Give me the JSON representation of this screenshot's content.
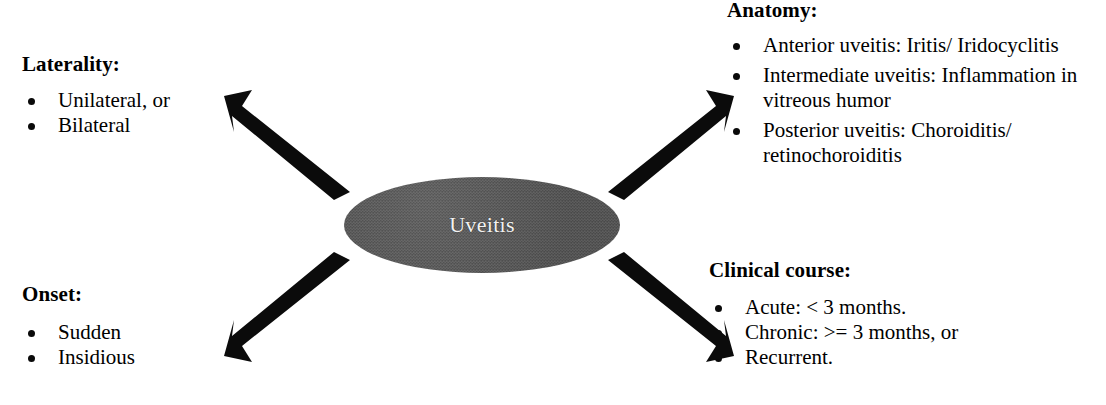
{
  "diagram": {
    "center": {
      "label": "Uveitis",
      "shape": "ellipse",
      "fill_color": "#565656",
      "text_color": "#f2f2f2"
    },
    "branches": [
      {
        "id": "laterality",
        "position": "top-left",
        "heading": "Laterality:",
        "items": [
          "Unilateral, or",
          "Bilateral"
        ]
      },
      {
        "id": "anatomy",
        "position": "top-right",
        "heading": "Anatomy:",
        "items": [
          "Anterior uveitis: Iritis/ Iridocyclitis",
          "Intermediate uveitis: Inflammation in vitreous humor",
          "Posterior uveitis: Choroiditis/ retinochoroiditis"
        ]
      },
      {
        "id": "onset",
        "position": "bottom-left",
        "heading": "Onset:",
        "items": [
          "Sudden",
          "Insidious"
        ]
      },
      {
        "id": "clinical_course",
        "position": "bottom-right",
        "heading": "Clinical course:",
        "items": [
          "Acute: < 3 months.",
          "Chronic: >= 3 months, or",
          "Recurrent."
        ]
      }
    ],
    "arrows": [
      {
        "id": "arrow-nw",
        "direction": "north-west",
        "points_to": "laterality",
        "color": "#0b0b0b"
      },
      {
        "id": "arrow-ne",
        "direction": "north-east",
        "points_to": "anatomy",
        "color": "#0b0b0b"
      },
      {
        "id": "arrow-sw",
        "direction": "south-west",
        "points_to": "onset",
        "color": "#0b0b0b"
      },
      {
        "id": "arrow-se",
        "direction": "south-east",
        "points_to": "clinical_course",
        "color": "#0b0b0b"
      }
    ],
    "background_color": "#ffffff",
    "text_color": "#000000"
  }
}
